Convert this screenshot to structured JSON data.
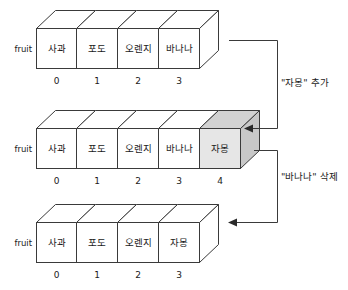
{
  "diagram": {
    "title_label": "fruit",
    "rows": [
      {
        "id": "row-before",
        "variable": "fruit",
        "cells": [
          {
            "value": "사과",
            "index": "0",
            "shaded": false
          },
          {
            "value": "포도",
            "index": "1",
            "shaded": false
          },
          {
            "value": "오렌지",
            "index": "2",
            "shaded": false
          },
          {
            "value": "바나나",
            "index": "3",
            "shaded": false
          }
        ]
      },
      {
        "id": "row-after-append",
        "variable": "fruit",
        "cells": [
          {
            "value": "사과",
            "index": "0",
            "shaded": false
          },
          {
            "value": "포도",
            "index": "1",
            "shaded": false
          },
          {
            "value": "오렌지",
            "index": "2",
            "shaded": false
          },
          {
            "value": "바나나",
            "index": "3",
            "shaded": false
          },
          {
            "value": "자몽",
            "index": "4",
            "shaded": true
          }
        ]
      },
      {
        "id": "row-after-remove",
        "variable": "fruit",
        "cells": [
          {
            "value": "사과",
            "index": "0",
            "shaded": false
          },
          {
            "value": "포도",
            "index": "1",
            "shaded": false
          },
          {
            "value": "오렌지",
            "index": "2",
            "shaded": false
          },
          {
            "value": "자몽",
            "index": "3",
            "shaded": false
          }
        ]
      }
    ],
    "annotations": [
      {
        "id": "annot-append",
        "text": "\"자몽\" 추가"
      },
      {
        "id": "annot-remove",
        "text": "\"바나나\" 삭제"
      }
    ],
    "colors": {
      "stroke": "#3a3a3a",
      "face_front": "#ffffff",
      "face_front_shaded": "#e6e6e6",
      "face_top_shaded": "#d2d2d2",
      "face_side_shaded": "#c8c8c8",
      "text": "#1a1a1a",
      "background": "#ffffff"
    }
  }
}
